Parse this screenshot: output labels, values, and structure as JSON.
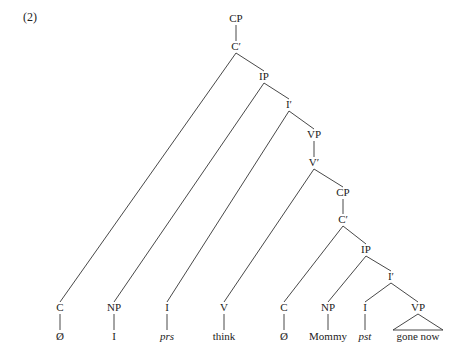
{
  "example_number": "(2)",
  "tree": {
    "nodes": [
      {
        "id": "cp1",
        "label": "CP"
      },
      {
        "id": "cbar1",
        "label": "C′"
      },
      {
        "id": "ip1",
        "label": "IP"
      },
      {
        "id": "ibar1",
        "label": "I′"
      },
      {
        "id": "vp1",
        "label": "VP"
      },
      {
        "id": "vbar1",
        "label": "V′"
      },
      {
        "id": "cp2",
        "label": "CP"
      },
      {
        "id": "cbar2",
        "label": "C′"
      },
      {
        "id": "ip2",
        "label": "IP"
      },
      {
        "id": "ibar2",
        "label": "I′"
      },
      {
        "id": "c1",
        "label": "C"
      },
      {
        "id": "np1",
        "label": "NP"
      },
      {
        "id": "i1",
        "label": "I"
      },
      {
        "id": "v1",
        "label": "V"
      },
      {
        "id": "c2",
        "label": "C"
      },
      {
        "id": "np2",
        "label": "NP"
      },
      {
        "id": "i2",
        "label": "I"
      },
      {
        "id": "vp2",
        "label": "VP"
      }
    ],
    "edges": [
      [
        "cp1",
        "cbar1"
      ],
      [
        "cbar1",
        "c1"
      ],
      [
        "cbar1",
        "ip1"
      ],
      [
        "ip1",
        "np1"
      ],
      [
        "ip1",
        "ibar1"
      ],
      [
        "ibar1",
        "i1"
      ],
      [
        "ibar1",
        "vp1"
      ],
      [
        "vp1",
        "vbar1"
      ],
      [
        "vbar1",
        "v1"
      ],
      [
        "vbar1",
        "cp2"
      ],
      [
        "cp2",
        "cbar2"
      ],
      [
        "cbar2",
        "c2"
      ],
      [
        "cbar2",
        "ip2"
      ],
      [
        "ip2",
        "np2"
      ],
      [
        "ip2",
        "ibar2"
      ],
      [
        "ibar2",
        "i2"
      ],
      [
        "ibar2",
        "vp2"
      ]
    ],
    "leaves": [
      {
        "parent": "c1",
        "word": "Ø",
        "italic": false,
        "triangle": false
      },
      {
        "parent": "np1",
        "word": "I",
        "italic": false,
        "triangle": false
      },
      {
        "parent": "i1",
        "word": "prs",
        "italic": true,
        "triangle": false
      },
      {
        "parent": "v1",
        "word": "think",
        "italic": false,
        "triangle": false
      },
      {
        "parent": "c2",
        "word": "Ø",
        "italic": false,
        "triangle": false
      },
      {
        "parent": "np2",
        "word": "Mommy",
        "italic": false,
        "triangle": false
      },
      {
        "parent": "i2",
        "word": "pst",
        "italic": true,
        "triangle": false
      },
      {
        "parent": "vp2",
        "word": "gone now",
        "italic": false,
        "triangle": true
      }
    ]
  }
}
